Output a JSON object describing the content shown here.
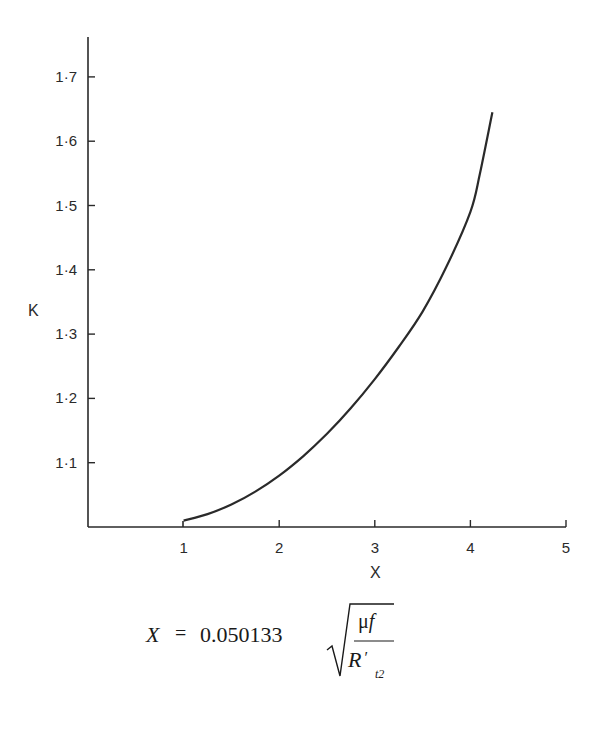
{
  "chart_data": {
    "type": "line",
    "title": "",
    "xlabel": "X",
    "ylabel": "K",
    "xlim": [
      0,
      5
    ],
    "ylim": [
      1.0,
      1.77
    ],
    "x_ticks": [
      "1",
      "2",
      "3",
      "4",
      "5"
    ],
    "y_ticks": [
      "1·1",
      "1·2",
      "1·3",
      "1·4",
      "1·5",
      "1·6",
      "1·7"
    ],
    "grid": false,
    "legend": null,
    "series": [
      {
        "name": "K vs X",
        "x": [
          1.0,
          1.25,
          1.5,
          1.75,
          2.0,
          2.25,
          2.5,
          2.75,
          3.0,
          3.25,
          3.5,
          3.75,
          4.0,
          4.1,
          4.23
        ],
        "y": [
          1.01,
          1.02,
          1.035,
          1.055,
          1.08,
          1.11,
          1.145,
          1.185,
          1.23,
          1.28,
          1.335,
          1.405,
          1.49,
          1.55,
          1.645
        ]
      }
    ],
    "annotations": [
      {
        "type": "formula",
        "text": "X = 0.050133 √(μf / R′t2)"
      }
    ]
  },
  "axes": {
    "x_label": "X",
    "y_label": "K",
    "x_ticks": [
      {
        "label": "1",
        "value": 1
      },
      {
        "label": "2",
        "value": 2
      },
      {
        "label": "3",
        "value": 3
      },
      {
        "label": "4",
        "value": 4
      },
      {
        "label": "5",
        "value": 5
      }
    ],
    "y_ticks": [
      {
        "label": "1·1",
        "value": 1.1
      },
      {
        "label": "1·2",
        "value": 1.2
      },
      {
        "label": "1·3",
        "value": 1.3
      },
      {
        "label": "1·4",
        "value": 1.4
      },
      {
        "label": "1·5",
        "value": 1.5
      },
      {
        "label": "1·6",
        "value": 1.6
      },
      {
        "label": "1·7",
        "value": 1.7
      }
    ]
  },
  "formula": {
    "lhs": "X",
    "equals": "=",
    "coefficient": "0.050133",
    "numerator_mu": "μ",
    "numerator_f": "f",
    "denominator_R": "R",
    "denominator_prime": "′",
    "denominator_sub": "t2"
  },
  "colors": {
    "ink": "#2a2a2a",
    "background": "#ffffff"
  }
}
